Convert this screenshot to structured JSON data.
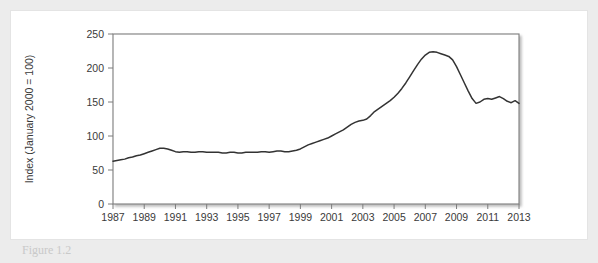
{
  "figure": {
    "caption": "Figure 1.2"
  },
  "chart_data": {
    "type": "line",
    "title": "",
    "xlabel": "",
    "ylabel": "Index (January 2000 = 100)",
    "xlim": [
      1987,
      2013
    ],
    "ylim": [
      0,
      250
    ],
    "grid": false,
    "legend": null,
    "line_color": "#333333",
    "xticks": [
      1987,
      1989,
      1991,
      1993,
      1995,
      1997,
      1999,
      2001,
      2003,
      2005,
      2007,
      2009,
      2011,
      2013
    ],
    "yticks": [
      0,
      50,
      100,
      150,
      200,
      250
    ],
    "series": [
      {
        "name": "Index (January 2000 = 100)",
        "x": [
          1987.0,
          1987.25,
          1987.5,
          1987.75,
          1988.0,
          1988.25,
          1988.5,
          1988.75,
          1989.0,
          1989.25,
          1989.5,
          1989.75,
          1990.0,
          1990.25,
          1990.5,
          1990.75,
          1991.0,
          1991.25,
          1991.5,
          1991.75,
          1992.0,
          1992.25,
          1992.5,
          1992.75,
          1993.0,
          1993.25,
          1993.5,
          1993.75,
          1994.0,
          1994.25,
          1994.5,
          1994.75,
          1995.0,
          1995.25,
          1995.5,
          1995.75,
          1996.0,
          1996.25,
          1996.5,
          1996.75,
          1997.0,
          1997.25,
          1997.5,
          1997.75,
          1998.0,
          1998.25,
          1998.5,
          1998.75,
          1999.0,
          1999.25,
          1999.5,
          1999.75,
          2000.0,
          2000.25,
          2000.5,
          2000.75,
          2001.0,
          2001.25,
          2001.5,
          2001.75,
          2002.0,
          2002.25,
          2002.5,
          2002.75,
          2003.0,
          2003.25,
          2003.5,
          2003.75,
          2004.0,
          2004.25,
          2004.5,
          2004.75,
          2005.0,
          2005.25,
          2005.5,
          2005.75,
          2006.0,
          2006.25,
          2006.5,
          2006.75,
          2007.0,
          2007.25,
          2007.5,
          2007.75,
          2008.0,
          2008.25,
          2008.5,
          2008.75,
          2009.0,
          2009.25,
          2009.5,
          2009.75,
          2010.0,
          2010.25,
          2010.5,
          2010.75,
          2011.0,
          2011.25,
          2011.5,
          2011.75,
          2012.0,
          2012.25,
          2012.5,
          2012.75,
          2013.0
        ],
        "y": [
          63,
          64,
          65,
          66,
          68,
          69,
          71,
          72,
          74,
          76,
          78,
          80,
          82,
          82,
          81,
          79,
          77,
          76,
          77,
          77,
          76,
          76,
          77,
          77,
          76,
          76,
          76,
          76,
          75,
          75,
          76,
          76,
          75,
          75,
          76,
          76,
          76,
          76,
          77,
          77,
          76,
          77,
          78,
          78,
          77,
          77,
          78,
          79,
          81,
          84,
          87,
          89,
          91,
          93,
          95,
          97,
          100,
          103,
          106,
          109,
          113,
          117,
          120,
          122,
          123,
          125,
          130,
          136,
          140,
          144,
          148,
          152,
          157,
          163,
          170,
          178,
          187,
          196,
          205,
          213,
          219,
          223,
          224,
          223,
          221,
          219,
          217,
          212,
          202,
          190,
          178,
          166,
          155,
          148,
          150,
          154,
          155,
          154,
          156,
          158,
          155,
          151,
          149,
          152,
          148
        ]
      }
    ]
  }
}
